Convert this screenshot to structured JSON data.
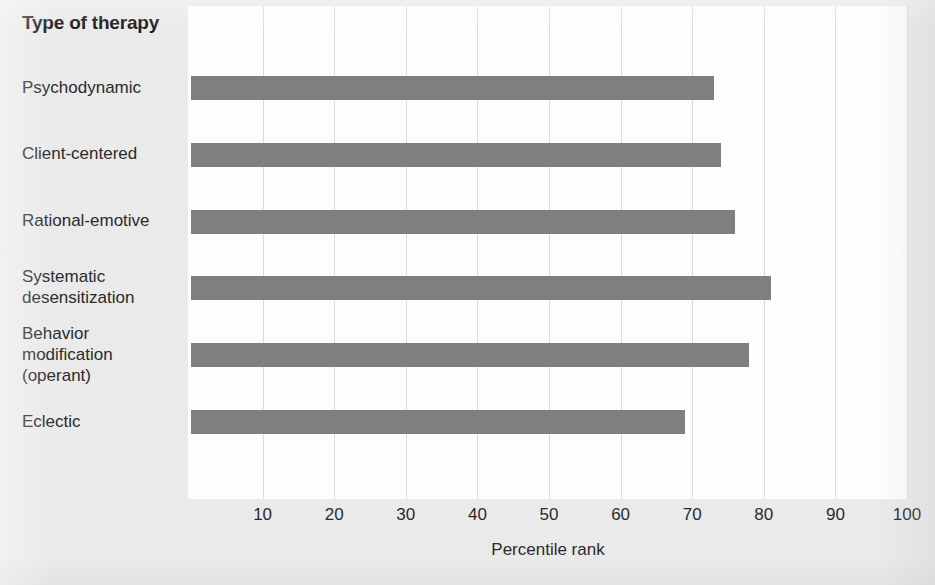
{
  "chart_data": {
    "type": "bar",
    "orientation": "horizontal",
    "title": "Type of therapy",
    "xlabel": "Percentile rank",
    "ylabel": "Type of therapy",
    "categories": [
      "Psychodynamic",
      "Client-centered",
      "Rational-emotive",
      "Systematic\ndesensitization",
      "Behavior\nmodification\n(operant)",
      "Eclectic"
    ],
    "values": [
      73,
      74,
      76,
      81,
      78,
      69
    ],
    "xlim": [
      0,
      100
    ],
    "xticks": [
      10,
      20,
      30,
      40,
      50,
      60,
      70,
      80,
      90,
      100
    ],
    "xtick_labels": [
      "10",
      "20",
      "30",
      "40",
      "50",
      "60",
      "70",
      "80",
      "90",
      "100"
    ],
    "grid": "vertical",
    "legend": "none",
    "bar_color": "#7f7f7f",
    "plot_background": "#fdfdfd",
    "figure_background": "#eaeaea",
    "gridline_color": "#dcdcdc",
    "text_color": "#2a2a2a"
  }
}
